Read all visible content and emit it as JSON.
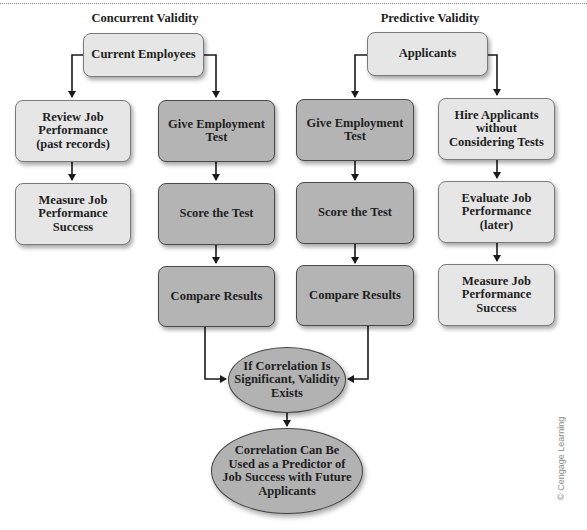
{
  "diagram": {
    "columns": {
      "concurrent": {
        "title": "Concurrent Validity",
        "root": "Current Employees",
        "branch_a": [
          "Review Job\nPerformance\n(past records)",
          "Measure Job\nPerformance\nSuccess"
        ],
        "branch_b": [
          "Give Employment\nTest",
          "Score the Test",
          "Compare Results"
        ]
      },
      "predictive": {
        "title": "Predictive Validity",
        "root": "Applicants",
        "branch_a": [
          "Give Employment\nTest",
          "Score the Test",
          "Compare Results"
        ],
        "branch_b": [
          "Hire Applicants\nwithout\nConsidering Tests",
          "Evaluate Job\nPerformance (later)",
          "Measure Job\nPerformance\nSuccess"
        ]
      }
    },
    "outcome": {
      "decision": "If Correlation Is\nSignificant, Validity\nExists",
      "result": "Correlation Can Be\nUsed as a Predictor of\nJob Success with Future\nApplicants"
    },
    "colors": {
      "light_box": "#e6e6e6",
      "dark_box": "#b4b4b4",
      "oval": "#b2b2b2",
      "border": "#4a4a4a",
      "connector": "#1a1a1a"
    },
    "credit": "© Cengage Learning"
  }
}
